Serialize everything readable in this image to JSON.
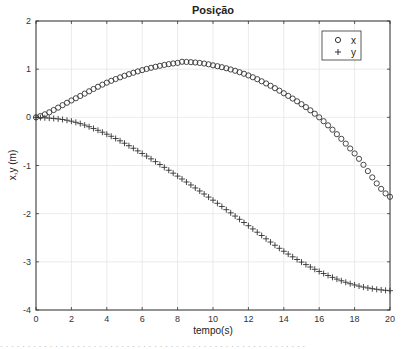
{
  "chart_data": {
    "type": "scatter",
    "title": "Posição",
    "xlabel": "tempo(s)",
    "ylabel": "x,y (m)",
    "xlim": [
      0,
      20
    ],
    "ylim": [
      -4,
      2
    ],
    "xticks": [
      0,
      2,
      4,
      6,
      8,
      10,
      12,
      14,
      16,
      18,
      20
    ],
    "yticks": [
      -4,
      -3,
      -2,
      -1,
      0,
      1,
      2
    ],
    "grid": true,
    "legend_position": "upper right",
    "marker_step": 0.25,
    "series": [
      {
        "name": "x",
        "marker": "o",
        "x": [
          0,
          2,
          4,
          6,
          8,
          8.5,
          10,
          12,
          14,
          16,
          18,
          20
        ],
        "values": [
          0,
          0.35,
          0.72,
          0.98,
          1.13,
          1.15,
          1.08,
          0.87,
          0.5,
          0.0,
          -0.75,
          -1.65
        ]
      },
      {
        "name": "y",
        "marker": "+",
        "x": [
          0,
          2,
          4,
          6,
          8,
          10,
          12,
          14,
          16,
          18,
          20
        ],
        "values": [
          0,
          -0.08,
          -0.35,
          -0.75,
          -1.22,
          -1.72,
          -2.25,
          -2.78,
          -3.2,
          -3.48,
          -3.6
        ]
      }
    ]
  },
  "colors": {
    "marker": "#333333",
    "axis": "#333333",
    "grid": "#e6e6e6"
  }
}
